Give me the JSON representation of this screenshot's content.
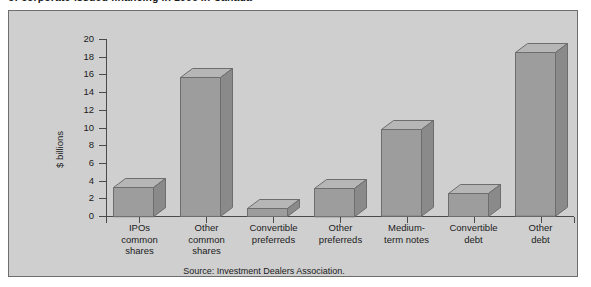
{
  "figure": {
    "caption": "of corporate-issued financing in 1996 in Canada",
    "source_note": "Source: Investment Dealers Association.",
    "panel_background": "#cfcfcf",
    "bar_face_color": "#9d9d9d",
    "bar_top_color": "#b6b6b6",
    "bar_side_color": "#8a8a8a",
    "axis_color": "#4a4a4a"
  },
  "chart_data": {
    "type": "bar",
    "title": "of corporate-issued financing in 1996 in Canada",
    "xlabel": "",
    "ylabel": "$ billions",
    "ylim": [
      0,
      20
    ],
    "ytick_step": 2,
    "yticks": [
      "20",
      "18",
      "16",
      "14",
      "12",
      "10",
      "8",
      "6",
      "4",
      "2",
      "0"
    ],
    "grid": false,
    "legend": "none",
    "three_d": true,
    "categories": [
      "IPOs common shares",
      "Other common shares",
      "Convertible preferreds",
      "Other preferreds",
      "Medium-term notes",
      "Convertible debt",
      "Other debt"
    ],
    "category_lines": [
      [
        "IPOs",
        "common",
        "shares"
      ],
      [
        "Other",
        "common",
        "shares"
      ],
      [
        "Convertible",
        "preferreds"
      ],
      [
        "Other",
        "preferreds"
      ],
      [
        "Medium-",
        "term notes"
      ],
      [
        "Convertible",
        "debt"
      ],
      [
        "Other",
        "debt"
      ]
    ],
    "values": [
      3.3,
      15.7,
      0.9,
      3.2,
      9.8,
      2.6,
      18.5
    ],
    "annotations": [
      "Source: Investment Dealers Association."
    ]
  }
}
